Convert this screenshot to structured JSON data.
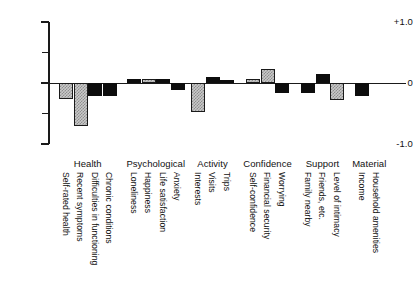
{
  "chart_data": {
    "type": "bar",
    "title": "",
    "subtitle": "",
    "xlabel": "",
    "ylabel": "",
    "ylim": [
      -1.0,
      1.0
    ],
    "yticks": [
      1.0,
      0.5,
      0,
      -0.5,
      -1.0
    ],
    "ytick_labels": [
      "+1.0",
      "",
      "0",
      "",
      "-1.0"
    ],
    "grid": false,
    "legend": "none",
    "orientation": "vertical",
    "zero_reference_line": true,
    "bar_styles": [
      "hatched",
      "solid-black"
    ],
    "groups": [
      {
        "name": "Health",
        "bars": [
          {
            "label": "Self-rated health",
            "value": -0.27,
            "style": "hatched"
          },
          {
            "label": "Recent symptoms",
            "value": -0.7,
            "style": "hatched"
          },
          {
            "label": "Difficulties in functioning",
            "value": -0.22,
            "style": "solid"
          },
          {
            "label": "Chronic conditions",
            "value": -0.22,
            "style": "solid"
          }
        ]
      },
      {
        "name": "Psychological",
        "bars": [
          {
            "label": "Loneliness",
            "value": 0.07,
            "style": "solid"
          },
          {
            "label": "Happiness",
            "value": 0.07,
            "style": "hatched"
          },
          {
            "label": "Life satisfaction",
            "value": 0.06,
            "style": "solid"
          },
          {
            "label": "Anxiety",
            "value": -0.11,
            "style": "solid"
          }
        ]
      },
      {
        "name": "Activity",
        "bars": [
          {
            "label": "Interests",
            "value": -0.47,
            "style": "hatched"
          },
          {
            "label": "Visits",
            "value": 0.1,
            "style": "solid"
          },
          {
            "label": "Trips",
            "value": 0.05,
            "style": "solid"
          }
        ]
      },
      {
        "name": "Confidence",
        "bars": [
          {
            "label": "Self-confidence",
            "value": 0.06,
            "style": "hatched"
          },
          {
            "label": "Financial security",
            "value": 0.23,
            "style": "hatched"
          },
          {
            "label": "Worrying",
            "value": -0.17,
            "style": "solid"
          }
        ]
      },
      {
        "name": "Support",
        "bars": [
          {
            "label": "Family nearby",
            "value": -0.16,
            "style": "solid"
          },
          {
            "label": "Friends, etc.",
            "value": 0.15,
            "style": "solid"
          },
          {
            "label": "Level of intimacy",
            "value": -0.28,
            "style": "hatched"
          }
        ]
      },
      {
        "name": "Material",
        "bars": [
          {
            "label": "Income",
            "value": -0.21,
            "style": "solid"
          },
          {
            "label": "Household amenities",
            "value": -0.01,
            "style": "solid"
          }
        ]
      }
    ]
  },
  "axis": {
    "top_label": "+1.0",
    "mid_label": "0",
    "bottom_label": "-1.0"
  }
}
